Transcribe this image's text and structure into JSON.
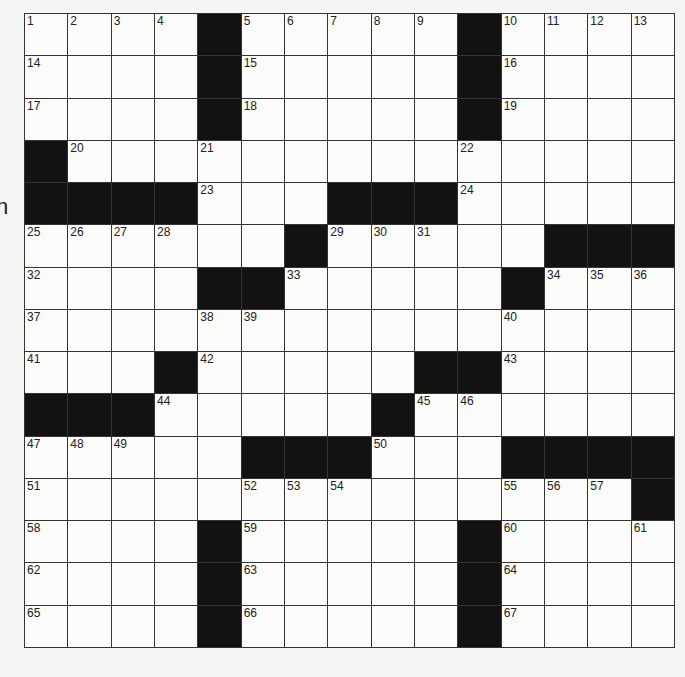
{
  "page": {
    "edge_fragment_text": "n"
  },
  "puzzle": {
    "rows": 15,
    "cols": 15,
    "colors": {
      "black_cell": "#121212",
      "white_cell": "#fbfbf9",
      "grid_line": "#333333",
      "number": "#222222"
    },
    "grid": [
      "....#.....#....",
      "....#.....#....",
      "....#.....#....",
      "#..............",
      "####...###.....",
      "......#.....###",
      "....##.....#...",
      "...............",
      "...#.....##....",
      "###.....#......",
      ".....###...####",
      "..............#",
      "....#.....#....",
      "....#.....#....",
      "....#.....#...."
    ],
    "numbers": [
      {
        "r": 0,
        "c": 0,
        "n": "1"
      },
      {
        "r": 0,
        "c": 1,
        "n": "2"
      },
      {
        "r": 0,
        "c": 2,
        "n": "3"
      },
      {
        "r": 0,
        "c": 3,
        "n": "4"
      },
      {
        "r": 0,
        "c": 5,
        "n": "5"
      },
      {
        "r": 0,
        "c": 6,
        "n": "6"
      },
      {
        "r": 0,
        "c": 7,
        "n": "7"
      },
      {
        "r": 0,
        "c": 8,
        "n": "8"
      },
      {
        "r": 0,
        "c": 9,
        "n": "9"
      },
      {
        "r": 0,
        "c": 11,
        "n": "10"
      },
      {
        "r": 0,
        "c": 12,
        "n": "11"
      },
      {
        "r": 0,
        "c": 13,
        "n": "12"
      },
      {
        "r": 0,
        "c": 14,
        "n": "13"
      },
      {
        "r": 1,
        "c": 0,
        "n": "14"
      },
      {
        "r": 1,
        "c": 5,
        "n": "15"
      },
      {
        "r": 1,
        "c": 11,
        "n": "16"
      },
      {
        "r": 2,
        "c": 0,
        "n": "17"
      },
      {
        "r": 2,
        "c": 5,
        "n": "18"
      },
      {
        "r": 2,
        "c": 11,
        "n": "19"
      },
      {
        "r": 3,
        "c": 1,
        "n": "20"
      },
      {
        "r": 3,
        "c": 4,
        "n": "21"
      },
      {
        "r": 3,
        "c": 10,
        "n": "22"
      },
      {
        "r": 4,
        "c": 4,
        "n": "23"
      },
      {
        "r": 4,
        "c": 10,
        "n": "24"
      },
      {
        "r": 5,
        "c": 0,
        "n": "25"
      },
      {
        "r": 5,
        "c": 1,
        "n": "26"
      },
      {
        "r": 5,
        "c": 2,
        "n": "27"
      },
      {
        "r": 5,
        "c": 3,
        "n": "28"
      },
      {
        "r": 5,
        "c": 7,
        "n": "29"
      },
      {
        "r": 5,
        "c": 8,
        "n": "30"
      },
      {
        "r": 5,
        "c": 9,
        "n": "31"
      },
      {
        "r": 6,
        "c": 0,
        "n": "32"
      },
      {
        "r": 6,
        "c": 6,
        "n": "33"
      },
      {
        "r": 6,
        "c": 12,
        "n": "34"
      },
      {
        "r": 6,
        "c": 13,
        "n": "35"
      },
      {
        "r": 6,
        "c": 14,
        "n": "36"
      },
      {
        "r": 7,
        "c": 0,
        "n": "37"
      },
      {
        "r": 7,
        "c": 4,
        "n": "38"
      },
      {
        "r": 7,
        "c": 5,
        "n": "39"
      },
      {
        "r": 7,
        "c": 11,
        "n": "40"
      },
      {
        "r": 8,
        "c": 0,
        "n": "41"
      },
      {
        "r": 8,
        "c": 4,
        "n": "42"
      },
      {
        "r": 8,
        "c": 11,
        "n": "43"
      },
      {
        "r": 9,
        "c": 3,
        "n": "44"
      },
      {
        "r": 9,
        "c": 9,
        "n": "45"
      },
      {
        "r": 9,
        "c": 10,
        "n": "46"
      },
      {
        "r": 10,
        "c": 0,
        "n": "47"
      },
      {
        "r": 10,
        "c": 1,
        "n": "48"
      },
      {
        "r": 10,
        "c": 2,
        "n": "49"
      },
      {
        "r": 10,
        "c": 8,
        "n": "50"
      },
      {
        "r": 11,
        "c": 0,
        "n": "51"
      },
      {
        "r": 11,
        "c": 5,
        "n": "52"
      },
      {
        "r": 11,
        "c": 6,
        "n": "53"
      },
      {
        "r": 11,
        "c": 7,
        "n": "54"
      },
      {
        "r": 11,
        "c": 11,
        "n": "55"
      },
      {
        "r": 11,
        "c": 12,
        "n": "56"
      },
      {
        "r": 11,
        "c": 13,
        "n": "57"
      },
      {
        "r": 12,
        "c": 0,
        "n": "58"
      },
      {
        "r": 12,
        "c": 5,
        "n": "59"
      },
      {
        "r": 12,
        "c": 11,
        "n": "60"
      },
      {
        "r": 12,
        "c": 14,
        "n": "61"
      },
      {
        "r": 13,
        "c": 0,
        "n": "62"
      },
      {
        "r": 13,
        "c": 5,
        "n": "63"
      },
      {
        "r": 13,
        "c": 11,
        "n": "64"
      },
      {
        "r": 14,
        "c": 0,
        "n": "65"
      },
      {
        "r": 14,
        "c": 5,
        "n": "66"
      },
      {
        "r": 14,
        "c": 11,
        "n": "67"
      }
    ]
  }
}
